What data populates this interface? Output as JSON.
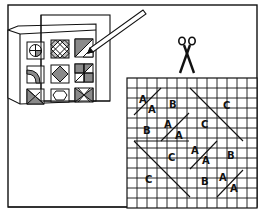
{
  "illustration": {
    "description": "Quilt pattern instructions: tile chart card with pencil, scissors, and grid paper with template pieces labeled A, B, C",
    "colors": {
      "line": "#111111",
      "fill_gray": "#8a8a8a",
      "background": "#ffffff"
    },
    "tile_chart": {
      "rows": 3,
      "cols": 3,
      "tiles": [
        "quarter-circle-cross",
        "lattice-diamonds",
        "half-square-triangle",
        "quarter-arc",
        "center-diamond",
        "four-patch-triangles",
        "corner-triangle",
        "octagon",
        "hourglass"
      ]
    },
    "tools": [
      "pencil-icon",
      "scissors-icon"
    ],
    "grid": {
      "cols": 13,
      "rows": 13,
      "labels": [
        {
          "text": "A",
          "x": 146,
          "y": 97
        },
        {
          "text": "A",
          "x": 153,
          "y": 109
        },
        {
          "text": "B",
          "x": 174,
          "y": 103
        },
        {
          "text": "C",
          "x": 226,
          "y": 106
        },
        {
          "text": "B",
          "x": 148,
          "y": 130
        },
        {
          "text": "A",
          "x": 168,
          "y": 125
        },
        {
          "text": "A",
          "x": 179,
          "y": 136
        },
        {
          "text": "C",
          "x": 204,
          "y": 126
        },
        {
          "text": "C",
          "x": 172,
          "y": 159
        },
        {
          "text": "A",
          "x": 195,
          "y": 151
        },
        {
          "text": "A",
          "x": 206,
          "y": 162
        },
        {
          "text": "B",
          "x": 231,
          "y": 157
        },
        {
          "text": "C",
          "x": 149,
          "y": 181
        },
        {
          "text": "B",
          "x": 204,
          "y": 182
        },
        {
          "text": "A",
          "x": 223,
          "y": 180
        },
        {
          "text": "A",
          "x": 234,
          "y": 191
        }
      ]
    }
  }
}
